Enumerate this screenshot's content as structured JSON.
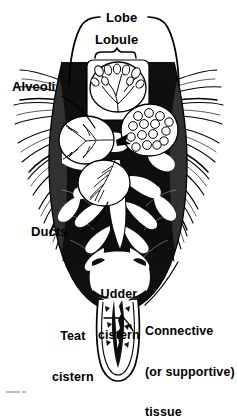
{
  "figure": {
    "kind": "anatomical-diagram",
    "ink_color": "#000000",
    "background_color": "#ffffff"
  },
  "labels": {
    "lobe": "Lobe",
    "lobule": "Lobule",
    "alveoli": "Alveoli",
    "ducts": "Ducts",
    "udder_cistern_line1": "Udder",
    "udder_cistern_line2": "cistern",
    "teat_cistern_line1": "Teat",
    "teat_cistern_line2": "cistern",
    "connective_line1": "Connective",
    "connective_line2": "(or supportive)",
    "connective_line3": "tissue"
  },
  "annotations": {
    "lobe_bracket": "large rounded bracket around upper udder",
    "lobule_brace": "small curly brace over lobule inset",
    "alveoli_leader": "curved leader line to alveoli cluster",
    "ducts_leader": "curved leader line to duct branches",
    "teat_leader": "horizontal leader with arrowhead to teat cistern",
    "connective_leader": "diagonal leader line to udder wall tissue"
  }
}
